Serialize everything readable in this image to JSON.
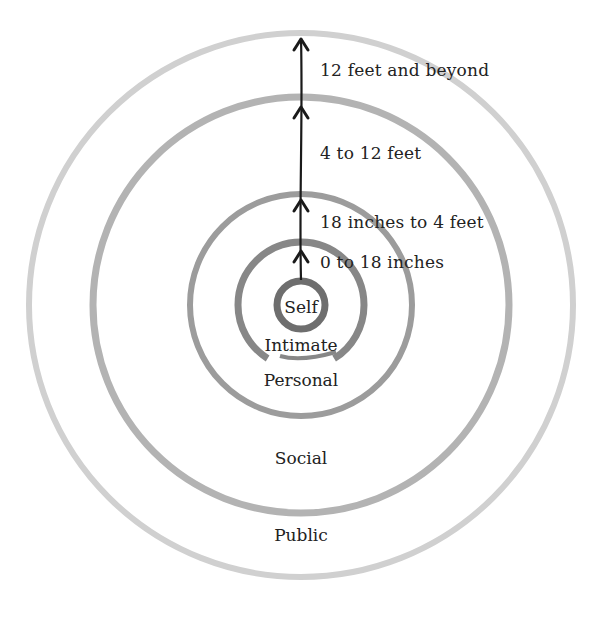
{
  "diagram": {
    "type": "proxemics-concentric-circles",
    "center": {
      "x": 301,
      "y": 305
    },
    "zones": [
      {
        "name": "Self",
        "radius": 24,
        "stroke": "#6e6e6e",
        "width": 7,
        "label_pos": {
          "x": 301,
          "y": 297
        }
      },
      {
        "name": "Intimate",
        "radius": 63,
        "stroke": "#878787",
        "width": 7,
        "label_pos": {
          "x": 301,
          "y": 335
        }
      },
      {
        "name": "Personal",
        "radius": 111,
        "stroke": "#9c9c9c",
        "width": 6,
        "label_pos": {
          "x": 301,
          "y": 370
        }
      },
      {
        "name": "Social",
        "radius": 208,
        "stroke": "#b3b3b3",
        "width": 7,
        "label_pos": {
          "x": 301,
          "y": 448
        }
      },
      {
        "name": "Public",
        "radius": 272,
        "stroke": "#d0d0d0",
        "width": 6,
        "label_pos": {
          "x": 301,
          "y": 525
        }
      }
    ],
    "distances": [
      {
        "label": "0 to 18 inches",
        "x": 320,
        "y": 252
      },
      {
        "label": "18 inches to 4 feet",
        "x": 320,
        "y": 212
      },
      {
        "label": "4 to 12 feet",
        "x": 320,
        "y": 143
      },
      {
        "label": "12 feet and beyond",
        "x": 320,
        "y": 60
      }
    ],
    "arrow": {
      "x": 301,
      "y_start": 280,
      "y_end": 38,
      "heads_y": [
        251,
        200,
        107,
        39
      ]
    }
  }
}
